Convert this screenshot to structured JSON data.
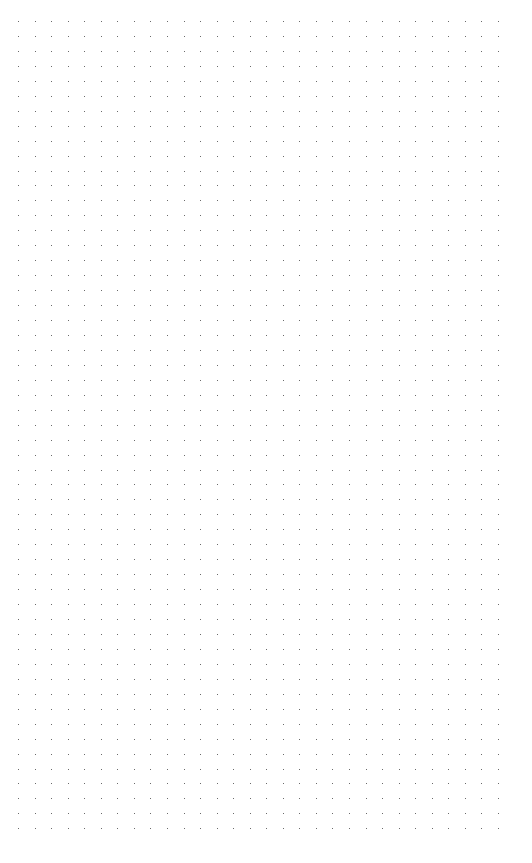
{
  "canvas": {
    "width": 532,
    "height": 863,
    "background": "#ffffff"
  },
  "dot_grid": {
    "origin_x": 18,
    "origin_y": 21,
    "spacing_x": 16.55,
    "spacing_y": 14.95,
    "columns": 30,
    "rows": 55,
    "dot_color": "#6a6a6a",
    "dot_size": 1
  }
}
